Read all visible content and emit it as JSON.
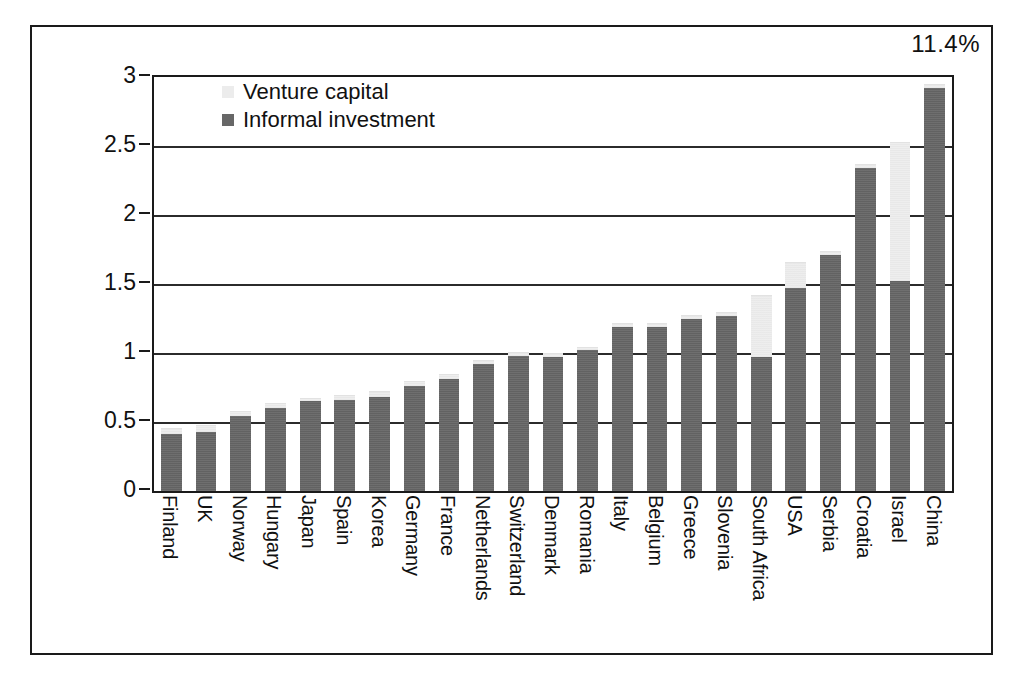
{
  "annotation": {
    "text": "11.4%"
  },
  "axes": {
    "ytitle_line1": "Informal investment and",
    "ytitle_line2": "Venture capital as percent of GDP",
    "yticks": [
      "3",
      "2.5",
      "2",
      "1.5",
      "1",
      "0.5",
      "0"
    ]
  },
  "legend": {
    "items": [
      {
        "label": "Venture capital",
        "color": "#ececec",
        "swatch": "light-square-icon"
      },
      {
        "label": "Informal investment",
        "color": "#676767",
        "swatch": "dark-square-icon"
      }
    ]
  },
  "chart_data": {
    "type": "bar",
    "title": "",
    "subtitle": "",
    "xlabel": "",
    "ylabel": "Informal investment and Venture capital as percent of GDP",
    "ylim": [
      0,
      3
    ],
    "ytick_values": [
      0,
      0.5,
      1,
      1.5,
      2,
      2.5,
      3
    ],
    "grid": true,
    "stacked": true,
    "legend_position": "top-left-inside",
    "annotations": [
      {
        "text": "11.4%",
        "position": "top-right",
        "note": "China off-scale total reference"
      }
    ],
    "categories": [
      "Finland",
      "UK",
      "Norway",
      "Hungary",
      "Japan",
      "Spain",
      "Korea",
      "Germany",
      "France",
      "Netherlands",
      "Switzerland",
      "Denmark",
      "Romania",
      "Italy",
      "Belgium",
      "Greece",
      "Slovenia",
      "South Africa",
      "USA",
      "Serbia",
      "Croatia",
      "Israel",
      "China"
    ],
    "series": [
      {
        "name": "Informal investment",
        "color": "#676767",
        "values": [
          0.41,
          0.43,
          0.54,
          0.6,
          0.65,
          0.66,
          0.68,
          0.76,
          0.81,
          0.92,
          0.98,
          0.97,
          1.02,
          1.19,
          1.19,
          1.25,
          1.27,
          0.97,
          1.47,
          1.71,
          2.34,
          1.52,
          2.92
        ]
      },
      {
        "name": "Venture capital",
        "color": "#ececec",
        "values": [
          0.04,
          0.04,
          0.03,
          0.03,
          0.02,
          0.03,
          0.04,
          0.03,
          0.03,
          0.02,
          0.02,
          0.02,
          0.02,
          0.02,
          0.02,
          0.02,
          0.02,
          0.44,
          0.18,
          0.02,
          0.02,
          1.0,
          0.02
        ]
      }
    ],
    "totals": [
      0.45,
      0.47,
      0.57,
      0.63,
      0.67,
      0.69,
      0.72,
      0.79,
      0.84,
      0.94,
      1.0,
      0.99,
      1.04,
      1.21,
      1.21,
      1.27,
      1.29,
      1.41,
      1.65,
      1.73,
      2.36,
      2.52,
      2.94
    ]
  }
}
